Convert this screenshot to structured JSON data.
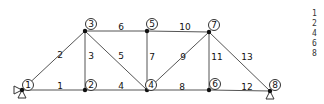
{
  "diagram": {
    "type": "truss",
    "nodes": [
      {
        "id": "1",
        "x": 22,
        "y": 90,
        "label_dx": 6,
        "label_dy": -5
      },
      {
        "id": "2",
        "x": 85,
        "y": 90,
        "label_dx": 6,
        "label_dy": -5
      },
      {
        "id": "3",
        "x": 85,
        "y": 31,
        "label_dx": 6,
        "label_dy": -7
      },
      {
        "id": "4",
        "x": 147,
        "y": 90,
        "label_dx": 4,
        "label_dy": -5
      },
      {
        "id": "5",
        "x": 147,
        "y": 31,
        "label_dx": 5,
        "label_dy": -7
      },
      {
        "id": "6",
        "x": 209,
        "y": 90,
        "label_dx": 6,
        "label_dy": -6
      },
      {
        "id": "7",
        "x": 209,
        "y": 32,
        "label_dx": 5,
        "label_dy": -7
      },
      {
        "id": "8",
        "x": 270,
        "y": 91,
        "label_dx": 5,
        "label_dy": -6
      }
    ],
    "members": [
      {
        "id": "1",
        "from": "1",
        "to": "2",
        "lx": 60,
        "ly": 86
      },
      {
        "id": "2",
        "from": "1",
        "to": "3",
        "lx": 60,
        "ly": 55
      },
      {
        "id": "3",
        "from": "2",
        "to": "3",
        "lx": 91,
        "ly": 56
      },
      {
        "id": "4",
        "from": "2",
        "to": "4",
        "lx": 121,
        "ly": 86
      },
      {
        "id": "5",
        "from": "3",
        "to": "4",
        "lx": 121,
        "ly": 56
      },
      {
        "id": "6",
        "from": "3",
        "to": "5",
        "lx": 121,
        "ly": 27
      },
      {
        "id": "7",
        "from": "4",
        "to": "5",
        "lx": 152,
        "ly": 57
      },
      {
        "id": "8",
        "from": "4",
        "to": "6",
        "lx": 182,
        "ly": 87
      },
      {
        "id": "9",
        "from": "4",
        "to": "7",
        "lx": 183,
        "ly": 57
      },
      {
        "id": "10",
        "from": "5",
        "to": "7",
        "lx": 185,
        "ly": 27
      },
      {
        "id": "11",
        "from": "6",
        "to": "7",
        "lx": 217,
        "ly": 57
      },
      {
        "id": "12",
        "from": "6",
        "to": "8",
        "lx": 247,
        "ly": 87
      },
      {
        "id": "13",
        "from": "7",
        "to": "8",
        "lx": 247,
        "ly": 57
      }
    ],
    "supports": [
      {
        "node": "1",
        "type": "pin-roller-combo"
      },
      {
        "node": "8",
        "type": "roller"
      }
    ]
  },
  "side_list": {
    "items": [
      "1",
      "2",
      "4",
      "6",
      "8"
    ]
  }
}
